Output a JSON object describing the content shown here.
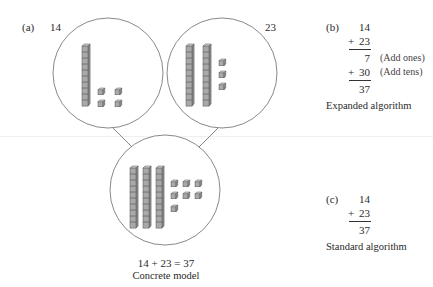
{
  "panel_a": {
    "tag": "(a)",
    "addend1_label": "14",
    "addend2_label": "23",
    "equation": "14 + 23 = 37",
    "caption": "Concrete model",
    "model1": {
      "tens": 1,
      "ones": 4
    },
    "model2": {
      "tens": 2,
      "ones": 3
    },
    "model_sum": {
      "tens": 3,
      "ones": 7
    }
  },
  "panel_b": {
    "tag": "(b)",
    "row1": "14",
    "row2_op": "+",
    "row2": "23",
    "row3": "7",
    "row3_note": "(Add ones)",
    "row4_op": "+",
    "row4": "30",
    "row4_note": "(Add tens)",
    "row5": "37",
    "caption": "Expanded algorithm"
  },
  "panel_c": {
    "tag": "(c)",
    "row1": "14",
    "row2_op": "+",
    "row2": "23",
    "row3": "37",
    "caption": "Standard algorithm"
  },
  "colors": {
    "block_fill": "#a9a9a9",
    "block_stroke": "#555555",
    "circle_stroke": "#6b6b6b"
  }
}
